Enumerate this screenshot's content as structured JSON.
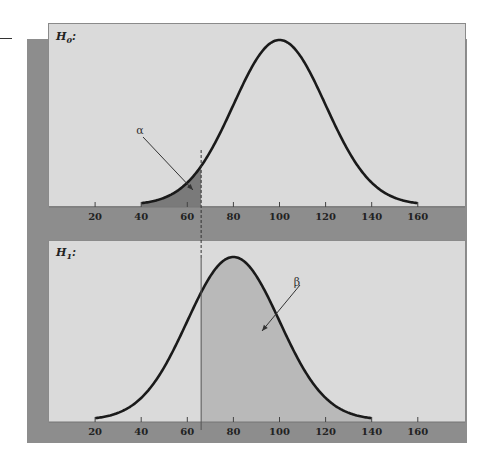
{
  "chart_data": [
    {
      "type": "area",
      "title": "H0:",
      "panel_label": "H",
      "panel_sub": "0",
      "distribution": {
        "kind": "normal",
        "mean": 100,
        "sd": 20,
        "x_range": [
          40,
          160
        ]
      },
      "shaded_region": {
        "from": 40,
        "to": 66,
        "label": "α",
        "meaning": "alpha (Type I error)"
      },
      "critical_value": 66,
      "xticks": [
        20,
        40,
        60,
        80,
        100,
        120,
        140,
        160
      ],
      "xlim": [
        0,
        180
      ],
      "grid": false
    },
    {
      "type": "area",
      "title": "H1:",
      "panel_label": "H",
      "panel_sub": "1",
      "distribution": {
        "kind": "normal",
        "mean": 80,
        "sd": 20,
        "x_range": [
          20,
          140
        ]
      },
      "shaded_region": {
        "from": 66,
        "to": 140,
        "label": "β",
        "meaning": "beta (Type II error)"
      },
      "critical_value": 66,
      "xticks": [
        20,
        40,
        60,
        80,
        100,
        120,
        140,
        160
      ],
      "xlim": [
        0,
        180
      ],
      "grid": false
    }
  ],
  "labels": {
    "h0_main": "H",
    "h0_sub": "0",
    "h1_main": "H",
    "h1_sub": "1",
    "colon": ":",
    "alpha": "α",
    "beta": "β"
  },
  "colors": {
    "panel_bg": "#dadada",
    "shadow": "#8d8d8d",
    "alpha_fill": "#7a7a7a",
    "beta_fill": "#b9b9b9",
    "curve": "#1a1a1a"
  }
}
